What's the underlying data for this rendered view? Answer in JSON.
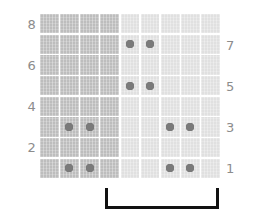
{
  "chart_data": {
    "type": "heatmap",
    "title": "",
    "xlabel": "",
    "ylabel": "",
    "grid": true,
    "legend_position": "none",
    "rows": 8,
    "columns": 9,
    "row_labels_left": [
      "8",
      "",
      "6",
      "",
      "4",
      "",
      "2",
      ""
    ],
    "row_labels_right": [
      "",
      "7",
      "",
      "5",
      "",
      "3",
      "",
      "1"
    ],
    "column_groups": [
      {
        "name": "dark-block",
        "columns": [
          1,
          2,
          3,
          4
        ],
        "color": "#bdbdbd"
      },
      {
        "name": "light-block",
        "columns": [
          5,
          6,
          7,
          8,
          9
        ],
        "color": "#e0e0e0"
      }
    ],
    "dot_color": "#7a7a7a",
    "marked_cells": [
      {
        "row": 7,
        "col": 5
      },
      {
        "row": 7,
        "col": 6
      },
      {
        "row": 5,
        "col": 5
      },
      {
        "row": 5,
        "col": 6
      },
      {
        "row": 3,
        "col": 2
      },
      {
        "row": 3,
        "col": 3
      },
      {
        "row": 3,
        "col": 7
      },
      {
        "row": 3,
        "col": 8
      },
      {
        "row": 1,
        "col": 2
      },
      {
        "row": 1,
        "col": 3
      },
      {
        "row": 1,
        "col": 7
      },
      {
        "row": 1,
        "col": 8
      }
    ],
    "annotation_bracket": {
      "shape": "u-bracket",
      "color": "#111111",
      "spans_columns": [
        5,
        9
      ],
      "label": ""
    }
  },
  "axes": {
    "left": {
      "ticks": [
        "8",
        "6",
        "4",
        "2"
      ]
    },
    "right": {
      "ticks": [
        "7",
        "5",
        "3",
        "1"
      ]
    }
  },
  "colors": {
    "dark_cell": "#bdbdbd",
    "light_cell": "#e0e0e0",
    "dot": "#7a7a7a",
    "label": "#8c8c8c",
    "bracket": "#111111",
    "background": "#ffffff"
  }
}
